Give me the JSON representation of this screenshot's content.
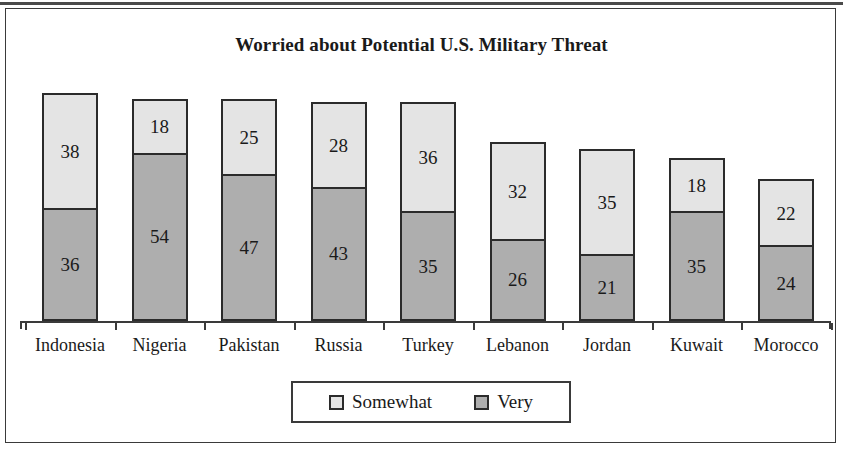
{
  "chart_data": {
    "type": "bar",
    "subtype": "stacked-bar",
    "title": "Worried about Potential U.S. Military Threat",
    "xlabel": "",
    "ylabel": "",
    "ylim": [
      0,
      74
    ],
    "grid": false,
    "legend_position": "bottom",
    "categories": [
      "Indonesia",
      "Nigeria",
      "Pakistan",
      "Russia",
      "Turkey",
      "Lebanon",
      "Jordan",
      "Kuwait",
      "Morocco"
    ],
    "series": [
      {
        "name": "Very",
        "values": [
          36,
          54,
          47,
          43,
          35,
          26,
          21,
          35,
          24
        ],
        "color": "#aeaeae"
      },
      {
        "name": "Somewhat",
        "values": [
          38,
          18,
          25,
          28,
          36,
          32,
          35,
          18,
          22
        ],
        "color": "#e4e4e4"
      }
    ],
    "totals": [
      74,
      72,
      72,
      71,
      71,
      58,
      56,
      53,
      46
    ]
  },
  "legend": {
    "items": [
      {
        "label": "Somewhat",
        "swatch": "light-gray-swatch"
      },
      {
        "label": "Very",
        "swatch": "medium-gray-swatch"
      }
    ]
  }
}
